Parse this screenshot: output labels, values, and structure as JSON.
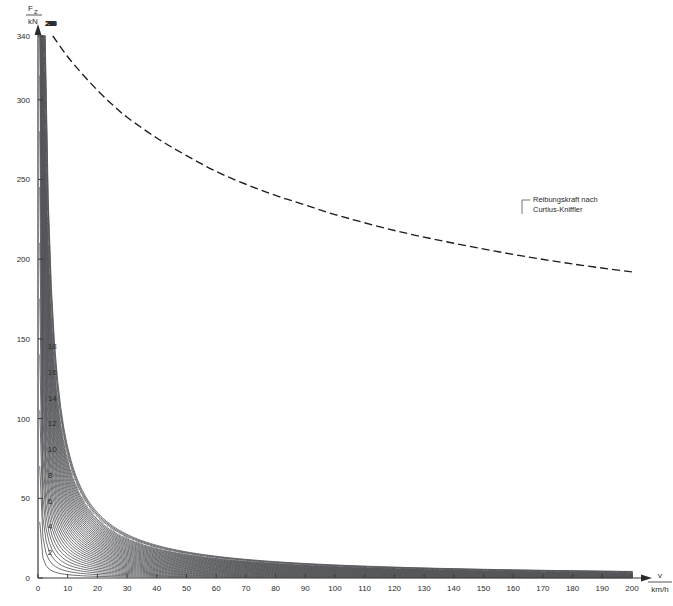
{
  "chart_data": {
    "type": "line",
    "title": "",
    "xlabel": "v",
    "xunit": "km/h",
    "ylabel": "F_Z",
    "yunit": "kN",
    "xlim": [
      0,
      200
    ],
    "ylim": [
      0,
      340
    ],
    "grid": false,
    "legend_position": "none",
    "x_ticks": [
      0,
      10,
      20,
      30,
      40,
      50,
      60,
      70,
      80,
      90,
      100,
      110,
      120,
      130,
      140,
      150,
      160,
      170,
      180,
      190,
      200
    ],
    "x_tick_labels": [
      "0",
      "10",
      "20",
      "30",
      "40",
      "50",
      "60",
      "70",
      "80",
      "90",
      "100",
      "110",
      "120",
      "130",
      "140",
      "150",
      "160",
      "170",
      "180",
      "190",
      "200"
    ],
    "y_ticks": [
      0,
      50,
      100,
      150,
      200,
      250,
      300,
      340
    ],
    "y_tick_labels": [
      "0",
      "50",
      "100",
      "150",
      "200",
      "250",
      "300",
      "340"
    ],
    "series_note": "Hyperbolic constant-power traction curves F = P/v, one per power step, clipped at F = 340 kN.",
    "power_series": [
      {
        "label": "",
        "power_index": 1,
        "show_label": false
      },
      {
        "label": "2",
        "power_index": 2,
        "show_label": true,
        "label_side": "axis"
      },
      {
        "label": "",
        "power_index": 3,
        "show_label": false
      },
      {
        "label": "4",
        "power_index": 4,
        "show_label": true,
        "label_side": "axis"
      },
      {
        "label": "",
        "power_index": 5,
        "show_label": false
      },
      {
        "label": "6",
        "power_index": 6,
        "show_label": true,
        "label_side": "axis"
      },
      {
        "label": "",
        "power_index": 7,
        "show_label": false
      },
      {
        "label": "8",
        "power_index": 8,
        "show_label": true,
        "label_side": "axis"
      },
      {
        "label": "",
        "power_index": 9,
        "show_label": false
      },
      {
        "label": "10",
        "power_index": 10,
        "show_label": true,
        "label_side": "axis"
      },
      {
        "label": "",
        "power_index": 11,
        "show_label": false
      },
      {
        "label": "12",
        "power_index": 12,
        "show_label": true,
        "label_side": "axis"
      },
      {
        "label": "",
        "power_index": 13,
        "show_label": false
      },
      {
        "label": "14",
        "power_index": 14,
        "show_label": true,
        "label_side": "axis"
      },
      {
        "label": "",
        "power_index": 15,
        "show_label": false
      },
      {
        "label": "16",
        "power_index": 16,
        "show_label": true,
        "label_side": "axis"
      },
      {
        "label": "",
        "power_index": 17,
        "show_label": false
      },
      {
        "label": "18",
        "power_index": 18,
        "show_label": true,
        "label_side": "axis"
      },
      {
        "label": "",
        "power_index": 19,
        "show_label": false
      },
      {
        "label": "20",
        "power_index": 20,
        "show_label": true,
        "label_side": "top"
      },
      {
        "label": "",
        "power_index": 21,
        "show_label": false
      },
      {
        "label": "22",
        "power_index": 22,
        "show_label": true,
        "label_side": "top"
      },
      {
        "label": "",
        "power_index": 23,
        "show_label": false
      },
      {
        "label": "24",
        "power_index": 24,
        "show_label": true,
        "label_side": "top"
      },
      {
        "label": "",
        "power_index": 25,
        "show_label": false
      },
      {
        "label": "26",
        "power_index": 26,
        "show_label": true,
        "label_side": "top"
      },
      {
        "label": "",
        "power_index": 27,
        "show_label": false
      },
      {
        "label": "28",
        "power_index": 28,
        "show_label": true,
        "label_side": "top"
      },
      {
        "label": "",
        "power_index": 29,
        "show_label": false
      },
      {
        "label": "30",
        "power_index": 30,
        "show_label": true,
        "label_side": "top"
      },
      {
        "label": "",
        "power_index": 31,
        "show_label": false
      },
      {
        "label": "32",
        "power_index": 32,
        "show_label": true,
        "label_side": "top"
      },
      {
        "label": "",
        "power_index": 33,
        "show_label": false
      },
      {
        "label": "34",
        "power_index": 34,
        "show_label": true,
        "label_side": "top"
      },
      {
        "label": "",
        "power_index": 35,
        "show_label": false
      },
      {
        "label": "36",
        "power_index": 36,
        "show_label": true,
        "label_side": "top",
        "style": "dash-dot"
      },
      {
        "label": "",
        "power_index": 37,
        "show_label": false
      },
      {
        "label": "38",
        "power_index": 38,
        "show_label": true,
        "label_side": "top"
      },
      {
        "label": "39",
        "power_index": 39,
        "show_label": true,
        "label_side": "top"
      }
    ],
    "annotations": [
      {
        "name": "curtius-kniffler",
        "line1": "Reibungskraft nach",
        "line2": "Curtius-Kniffler",
        "style": "dashed",
        "points": [
          {
            "v": 5,
            "F": 340
          },
          {
            "v": 10,
            "F": 327
          },
          {
            "v": 15,
            "F": 316
          },
          {
            "v": 20,
            "F": 306
          },
          {
            "v": 25,
            "F": 297
          },
          {
            "v": 30,
            "F": 289
          },
          {
            "v": 40,
            "F": 276
          },
          {
            "v": 50,
            "F": 265
          },
          {
            "v": 60,
            "F": 255
          },
          {
            "v": 70,
            "F": 247
          },
          {
            "v": 80,
            "F": 240
          },
          {
            "v": 90,
            "F": 234
          },
          {
            "v": 100,
            "F": 228
          },
          {
            "v": 120,
            "F": 218
          },
          {
            "v": 140,
            "F": 210
          },
          {
            "v": 160,
            "F": 203
          },
          {
            "v": 180,
            "F": 197
          },
          {
            "v": 200,
            "F": 192
          }
        ]
      }
    ]
  },
  "axis": {
    "y_numerator": "F",
    "y_subscript": "Z",
    "y_denominator": "kN",
    "x_numerator": "v",
    "x_denominator": "km/h"
  }
}
